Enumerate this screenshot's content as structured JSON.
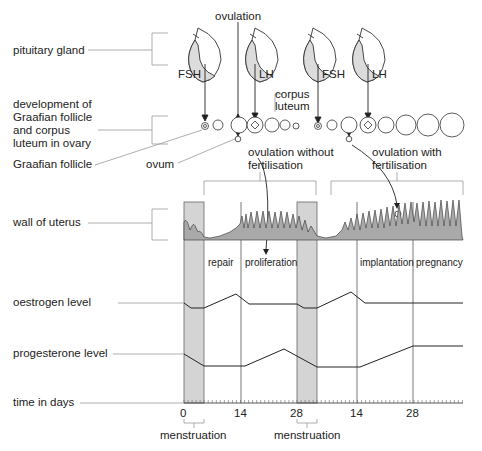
{
  "labels": {
    "pituitary_gland": "pituitary gland",
    "ovary_development_line1": "development of",
    "ovary_development_line2": "Graafian follicle",
    "ovary_development_line3": "and corpus",
    "ovary_development_line4": "luteum in ovary",
    "graafian_follicle": "Graafian follicle",
    "ovum": "ovum",
    "wall_of_uterus": "wall of uterus",
    "oestrogen_level": "oestrogen level",
    "progesterone_level": "progesterone level",
    "time_in_days": "time in days",
    "ovulation": "ovulation",
    "corpus_luteum_line1": "corpus",
    "corpus_luteum_line2": "luteum",
    "ovulation_without_line1": "ovulation without",
    "ovulation_without_line2": "fertilisation",
    "ovulation_with_line1": "ovulation with",
    "ovulation_with_line2": "fertilisation",
    "menstruation_1": "menstruation",
    "menstruation_2": "menstruation"
  },
  "hormones": {
    "fsh_1": "FSH",
    "lh_1": "LH",
    "fsh_2": "FSH",
    "lh_2": "LH"
  },
  "phases": {
    "repair": "repair",
    "proliferation": "proliferation",
    "implantation": "implantation",
    "pregnancy": "pregnancy"
  },
  "axis": {
    "ticks": [
      "0",
      "14",
      "28",
      "14",
      "28"
    ]
  },
  "colors": {
    "line": "#333333",
    "menstruation_band": "#d4d4d4",
    "uterus_fill": "#a9a9a9",
    "gland_fill": "#dcdcdc",
    "guide": "#999999"
  }
}
